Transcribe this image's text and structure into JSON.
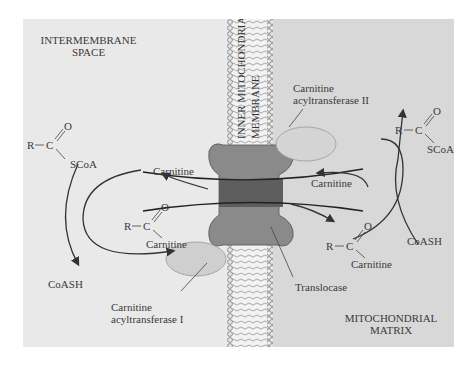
{
  "diagram": {
    "regions": {
      "intermembrane_space": [
        "INTERMEMBRANE",
        "SPACE"
      ],
      "mitochondrial_matrix": [
        "MITOCHONDRIAL",
        "MATRIX"
      ],
      "membrane": [
        "INNER MITOCHONDRIAL",
        "MEMBRANE"
      ]
    },
    "enzymes": {
      "cat1": [
        "Carnitine",
        "acyltransferase I"
      ],
      "cat2": [
        "Carnitine",
        "acyltransferase II"
      ],
      "translocase": "Translocase"
    },
    "left": {
      "acyl_coa": {
        "r": "R",
        "c": "C",
        "o": "O",
        "group": "SCoA"
      },
      "carnitine_out": "Carnitine",
      "acyl_carnitine": {
        "r": "R",
        "c": "C",
        "o": "O",
        "group": "Carnitine"
      },
      "coash": "CoASH"
    },
    "right": {
      "acyl_coa": {
        "r": "R",
        "c": "C",
        "o": "O",
        "group": "SCoA"
      },
      "carnitine_in": "Carnitine",
      "acyl_carnitine": {
        "r": "R",
        "c": "C",
        "o": "O",
        "group": "Carnitine"
      },
      "coash": "CoASH"
    },
    "colors": {
      "left_bg": "#e9e9e9",
      "right_bg": "#d8d8d8",
      "membrane_bg": "#f2f2f2",
      "translocase_light": "#8a8a8a",
      "translocase_dark": "#5e5e5e",
      "enzyme": "#cfcfcf",
      "arrow": "#333333"
    }
  }
}
